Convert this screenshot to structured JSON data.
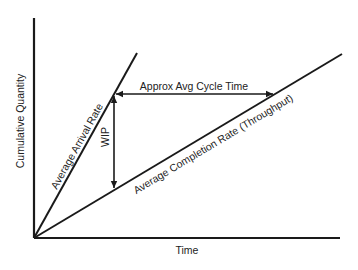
{
  "diagram": {
    "axes": {
      "x_label": "Time",
      "y_label": "Cumulative Quantity"
    },
    "lines": [
      {
        "id": "arrival",
        "label": "Average Arrival Rate"
      },
      {
        "id": "completion",
        "label": "Average Completion Rate (Throughput)"
      }
    ],
    "annotations": {
      "cycle_time": "Approx Avg Cycle Time",
      "wip": "WIP"
    },
    "colors": {
      "line": "#1a1a1a",
      "text": "#222222",
      "background": "#ffffff"
    }
  }
}
